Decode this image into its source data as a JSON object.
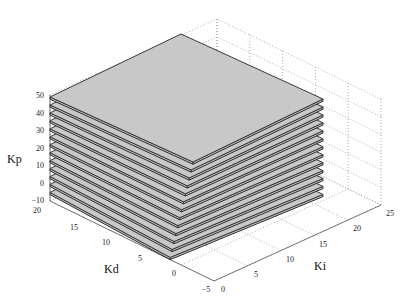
{
  "chart_data": {
    "type": "surface3d",
    "title": "",
    "axes": {
      "x": {
        "label": "Ki",
        "ticks": [
          0,
          5,
          10,
          15,
          20,
          25
        ],
        "range": [
          0,
          25
        ]
      },
      "y": {
        "label": "Kd",
        "ticks": [
          -5,
          0,
          5,
          10,
          15,
          20
        ],
        "range": [
          -5,
          20
        ]
      },
      "z": {
        "label": "Kp",
        "ticks": [
          -10,
          0,
          10,
          20,
          30,
          40,
          50
        ],
        "range": [
          -10,
          50
        ]
      }
    },
    "grid": true,
    "surface_color": "#c8c8c8",
    "edge_color": "#333333",
    "layers_kp": [
      48,
      43.5,
      39,
      34.5,
      30,
      25.5,
      21,
      16.5,
      12,
      7.5,
      3,
      -1.5,
      -6
    ]
  },
  "labels": {
    "z_axis": "Kp",
    "y_axis": "Kd",
    "x_axis": "Ki",
    "z_ticks": [
      "50",
      "40",
      "30",
      "20",
      "10",
      "0",
      "−10"
    ],
    "y_ticks": [
      "20",
      "15",
      "10",
      "5",
      "0",
      "−5"
    ],
    "x_ticks": [
      "0",
      "5",
      "10",
      "15",
      "20",
      "25"
    ]
  }
}
